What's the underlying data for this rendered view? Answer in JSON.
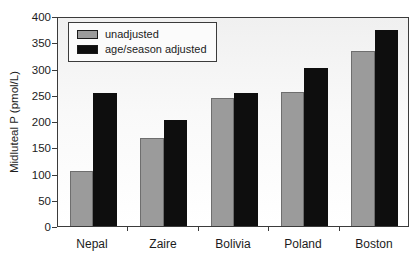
{
  "chart_data": {
    "type": "bar",
    "title": "",
    "xlabel": "",
    "ylabel": "Midluteal P (pmol/L)",
    "categories": [
      "Nepal",
      "Zaire",
      "Bolivia",
      "Poland",
      "Boston"
    ],
    "series": [
      {
        "name": "unadjusted",
        "color": "#9b9b9b",
        "values": [
          105,
          168,
          244,
          255,
          333
        ]
      },
      {
        "name": "age/season adjusted",
        "color": "#0e0e0e",
        "values": [
          253,
          202,
          253,
          300,
          373
        ]
      }
    ],
    "ylim": [
      0,
      400
    ],
    "yticks": [
      0,
      50,
      100,
      150,
      200,
      250,
      300,
      350,
      400
    ],
    "grid": false,
    "legend_position": "top-left",
    "plot_border_color": "#3b3b3b"
  }
}
